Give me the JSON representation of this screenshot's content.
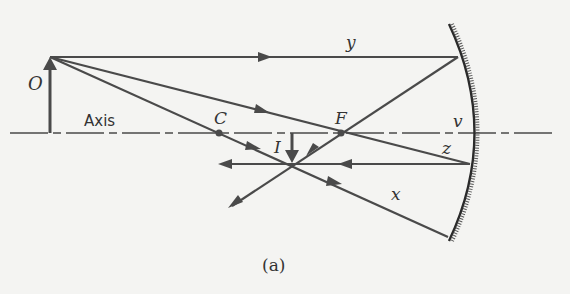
{
  "diagram": {
    "type": "concave-mirror-ray-diagram",
    "caption": "(a)",
    "axis_label": "Axis",
    "points": {
      "object": {
        "label": "O"
      },
      "center": {
        "label": "C"
      },
      "focus": {
        "label": "F"
      },
      "image": {
        "label": "I"
      },
      "vertex": {
        "label": "v"
      }
    },
    "rays": [
      {
        "label": "y"
      },
      {
        "label": "z"
      },
      {
        "label": "x"
      }
    ],
    "colors": {
      "line": "#4a4a4a",
      "background": "#f4f4f2",
      "mirror": "#2a2a2a"
    }
  }
}
